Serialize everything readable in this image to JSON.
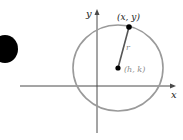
{
  "diagram": {
    "axes": {
      "x_label": "x",
      "y_label": "y"
    },
    "point_label": "(x, y)",
    "center_label": "(h, k)",
    "radius_label": "r",
    "colors": {
      "circle": "#9a9a9a",
      "axes": "#4a4a4a",
      "labels": "#222222",
      "center_label": "#8a8a8a",
      "radius_label": "#8a8a8a"
    }
  }
}
